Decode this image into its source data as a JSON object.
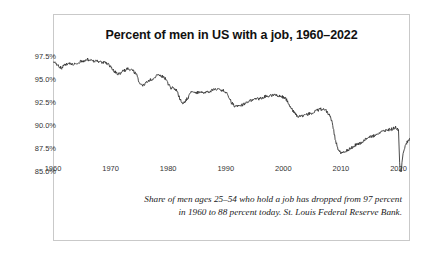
{
  "figure": {
    "title": "Percent of men in US with a job, 1960–2022",
    "caption_line_1": "Share of men ages 25–54 who hold a job has dropped from 97 percent",
    "caption_line_2": "in 1960 to 88 percent today. St. Louis Federal Reserve Bank.",
    "border_color": "#c9c9c9",
    "background_color": "#ffffff",
    "line_color": "#2b2b2b"
  },
  "chart_data": {
    "type": "line",
    "title": "Percent of men in US with a job, 1960–2022",
    "xlabel": "",
    "ylabel": "",
    "xlim": [
      1960,
      2022
    ],
    "ylim": [
      85.0,
      98.0
    ],
    "grid": false,
    "legend": "none",
    "xticks": [
      1960,
      1970,
      1980,
      1990,
      2000,
      2010,
      2020
    ],
    "xtick_labels": [
      "1960",
      "1970",
      "1980",
      "1990",
      "2000",
      "2010",
      "2020"
    ],
    "yticks": [
      85.0,
      87.5,
      90.0,
      92.5,
      95.0,
      97.5
    ],
    "ytick_labels": [
      "85.0%",
      "87.5%",
      "90.0%",
      "92.5%",
      "95.0%",
      "97.5%"
    ],
    "series": [
      {
        "name": "Employment-population ratio, men 25–54",
        "color": "#2b2b2b",
        "x": [
          1960.0,
          1960.5,
          1961.0,
          1961.5,
          1962.0,
          1962.5,
          1963.0,
          1963.5,
          1964.0,
          1964.5,
          1965.0,
          1965.5,
          1966.0,
          1966.5,
          1967.0,
          1967.5,
          1968.0,
          1968.5,
          1969.0,
          1969.5,
          1970.0,
          1970.5,
          1971.0,
          1971.5,
          1972.0,
          1972.5,
          1973.0,
          1973.5,
          1974.0,
          1974.5,
          1975.0,
          1975.5,
          1976.0,
          1976.5,
          1977.0,
          1977.5,
          1978.0,
          1978.5,
          1979.0,
          1979.5,
          1980.0,
          1980.5,
          1981.0,
          1981.5,
          1982.0,
          1982.5,
          1983.0,
          1983.5,
          1984.0,
          1984.5,
          1985.0,
          1985.5,
          1986.0,
          1986.5,
          1987.0,
          1987.5,
          1988.0,
          1988.5,
          1989.0,
          1989.5,
          1990.0,
          1990.5,
          1991.0,
          1991.5,
          1992.0,
          1992.5,
          1993.0,
          1993.5,
          1994.0,
          1994.5,
          1995.0,
          1995.5,
          1996.0,
          1996.5,
          1997.0,
          1997.5,
          1998.0,
          1998.5,
          1999.0,
          1999.5,
          2000.0,
          2000.5,
          2001.0,
          2001.5,
          2002.0,
          2002.5,
          2003.0,
          2003.5,
          2004.0,
          2004.5,
          2005.0,
          2005.5,
          2006.0,
          2006.5,
          2007.0,
          2007.5,
          2008.0,
          2008.5,
          2009.0,
          2009.5,
          2010.0,
          2010.5,
          2011.0,
          2011.5,
          2012.0,
          2012.5,
          2013.0,
          2013.5,
          2014.0,
          2014.5,
          2015.0,
          2015.5,
          2016.0,
          2016.5,
          2017.0,
          2017.5,
          2018.0,
          2018.5,
          2019.0,
          2019.5,
          2020.0,
          2020.2,
          2020.4,
          2020.6,
          2020.8,
          2021.0,
          2021.5,
          2022.0
        ],
        "values": [
          96.9,
          96.8,
          96.4,
          96.3,
          96.6,
          96.7,
          96.7,
          96.6,
          96.8,
          96.9,
          97.0,
          97.1,
          97.2,
          97.1,
          97.0,
          97.0,
          97.0,
          96.9,
          96.9,
          96.7,
          96.4,
          96.0,
          95.7,
          95.6,
          95.9,
          96.0,
          96.2,
          96.1,
          95.9,
          95.5,
          94.7,
          94.3,
          94.6,
          94.8,
          95.0,
          95.1,
          95.4,
          95.5,
          95.4,
          95.1,
          94.5,
          94.1,
          94.1,
          93.8,
          93.0,
          92.5,
          92.7,
          93.1,
          93.6,
          93.7,
          93.6,
          93.6,
          93.6,
          93.6,
          93.7,
          93.8,
          93.9,
          94.0,
          93.9,
          93.9,
          93.7,
          93.2,
          92.5,
          92.2,
          92.1,
          92.1,
          92.3,
          92.5,
          92.7,
          92.8,
          92.9,
          92.9,
          93.0,
          93.1,
          93.2,
          93.2,
          93.3,
          93.3,
          93.3,
          93.2,
          93.1,
          92.9,
          92.3,
          91.8,
          91.3,
          91.0,
          91.0,
          91.1,
          91.2,
          91.3,
          91.4,
          91.6,
          91.7,
          91.8,
          91.8,
          91.6,
          91.2,
          90.3,
          88.6,
          87.5,
          87.1,
          87.2,
          87.3,
          87.5,
          87.7,
          87.9,
          88.0,
          88.2,
          88.4,
          88.6,
          88.8,
          88.9,
          89.0,
          89.2,
          89.3,
          89.4,
          89.5,
          89.6,
          89.7,
          89.8,
          89.6,
          86.0,
          84.2,
          86.0,
          87.0,
          87.5,
          88.2,
          88.6
        ]
      }
    ],
    "annotations": [
      "Recession dips visible at 1975, 1982, 1991, 2001, 2009",
      "Sharp COVID-19 trough in 2020 reaching about 84%"
    ]
  }
}
